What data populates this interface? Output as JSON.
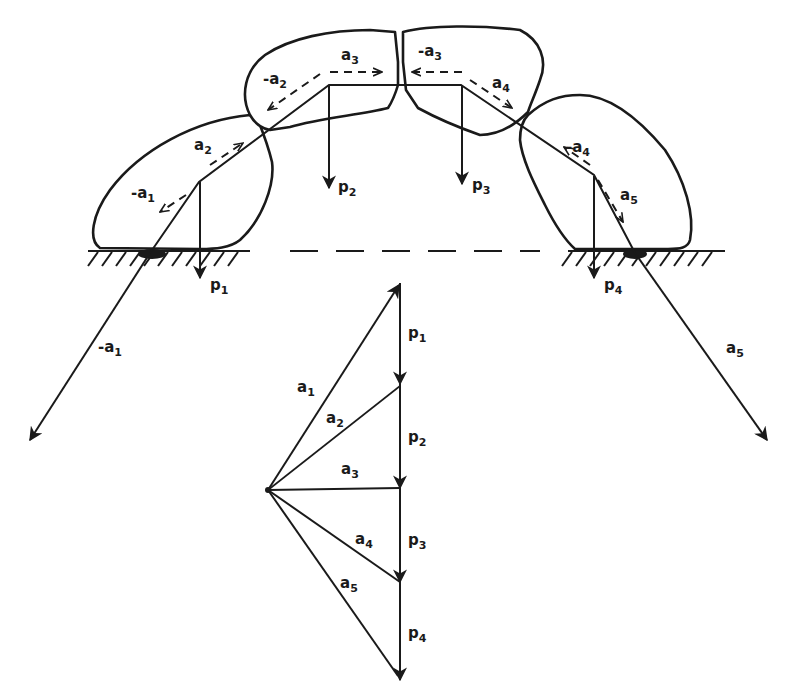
{
  "diagram": {
    "stones": 5,
    "colors": {
      "ink": "#1a1a1a",
      "background": "#ffffff"
    },
    "arch_labels": {
      "neg_a1": {
        "base": "-a",
        "sub": "1"
      },
      "a2": {
        "base": "a",
        "sub": "2"
      },
      "neg_a2": {
        "base": "-a",
        "sub": "2"
      },
      "a3": {
        "base": "a",
        "sub": "3"
      },
      "neg_a3": {
        "base": "-a",
        "sub": "3"
      },
      "a4": {
        "base": "a",
        "sub": "4"
      },
      "neg_a4": {
        "base": "-a",
        "sub": "4"
      },
      "a5": {
        "base": "a",
        "sub": "5"
      },
      "p1": {
        "base": "p",
        "sub": "1"
      },
      "p2": {
        "base": "p",
        "sub": "2"
      },
      "p3": {
        "base": "p",
        "sub": "3"
      },
      "p4": {
        "base": "p",
        "sub": "4"
      },
      "reaction_left": {
        "base": "-a",
        "sub": "1"
      },
      "reaction_right": {
        "base": "a",
        "sub": "5"
      }
    },
    "force_polygon": {
      "loads": [
        {
          "base": "p",
          "sub": "1"
        },
        {
          "base": "p",
          "sub": "2"
        },
        {
          "base": "p",
          "sub": "3"
        },
        {
          "base": "p",
          "sub": "4"
        }
      ],
      "rays": [
        {
          "base": "a",
          "sub": "1"
        },
        {
          "base": "a",
          "sub": "2"
        },
        {
          "base": "a",
          "sub": "3"
        },
        {
          "base": "a",
          "sub": "4"
        },
        {
          "base": "a",
          "sub": "5"
        }
      ]
    },
    "caption": "Figure — thrust line of an arch"
  }
}
